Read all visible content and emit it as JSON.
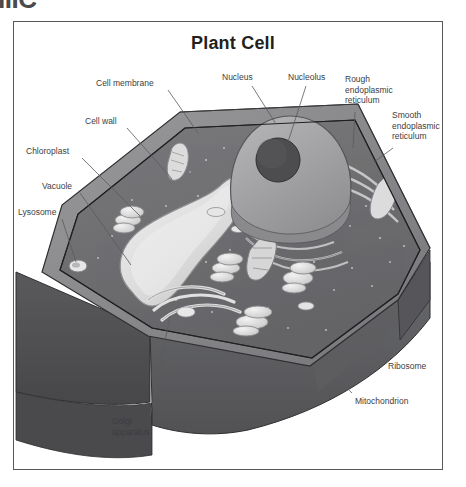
{
  "artifact": {
    "clipped_text": "IIIC"
  },
  "figure": {
    "title": "Plant Cell",
    "type": "labeled-biological-diagram",
    "frame": {
      "border_color": "#58585a",
      "background": "#ffffff"
    },
    "palette": {
      "cytoplasm": "#6e6e70",
      "cell_wall": "#8b8b8d",
      "cell_wall_dark": "#57575a",
      "side_face_left": "#4f4f52",
      "side_face_right": "#5d5d60",
      "nucleus": "#a6a6a8",
      "nucleus_shadow": "#7b7b7e",
      "nucleolus": "#4a4a4c",
      "vacuole": "#d8d8d8",
      "organelle_light": "#e3e3e3",
      "outline": "#2f2f31",
      "leader_line": "#5a5a5c",
      "label_text": "#3d3d3f"
    },
    "labels": [
      {
        "id": "cell-membrane",
        "text": "Cell membrane",
        "x": 96,
        "y": 80,
        "align": "left",
        "leader": [
          [
            168,
            90
          ],
          [
            196,
            132
          ]
        ]
      },
      {
        "id": "cell-wall",
        "text": "Cell wall",
        "x": 85,
        "y": 118,
        "align": "left",
        "leader": [
          [
            127,
            128
          ],
          [
            171,
            178
          ]
        ]
      },
      {
        "id": "chloroplast",
        "text": "Chloroplast",
        "x": 26,
        "y": 148,
        "align": "left",
        "leader": [
          [
            80,
            158
          ],
          [
            140,
            215
          ]
        ]
      },
      {
        "id": "vacuole",
        "text": "Vacuole",
        "x": 42,
        "y": 183,
        "align": "left",
        "leader": [
          [
            80,
            193
          ],
          [
            130,
            264
          ]
        ]
      },
      {
        "id": "lysosome",
        "text": "Lysosome",
        "x": 20,
        "y": 209,
        "align": "left",
        "leader": [
          [
            66,
            219
          ],
          [
            78,
            265
          ]
        ]
      },
      {
        "id": "nucleus",
        "text": "Nucleus",
        "x": 222,
        "y": 74,
        "align": "left",
        "leader": [
          [
            254,
            86
          ],
          [
            275,
            122
          ]
        ]
      },
      {
        "id": "nucleolus",
        "text": "Nucleolus",
        "x": 288,
        "y": 74,
        "align": "left",
        "leader": [
          [
            304,
            86
          ],
          [
            287,
            140
          ]
        ]
      },
      {
        "id": "rough-endoplasmic-reticulum",
        "text": "Rough\nendoplasmic\nreticulum",
        "x": 345,
        "y": 76,
        "align": "left",
        "leader": [
          [
            355,
            112
          ],
          [
            354,
            146
          ]
        ]
      },
      {
        "id": "smooth-endoplasmic-reticulum",
        "text": "Smooth\nendoplasmic\nreticulum",
        "x": 392,
        "y": 112,
        "align": "left",
        "leader": [
          [
            392,
            148
          ],
          [
            375,
            160
          ]
        ]
      },
      {
        "id": "ribosome",
        "text": "Ribosome",
        "x": 388,
        "y": 364,
        "align": "left",
        "leader": [
          [
            387,
            362
          ],
          [
            360,
            335
          ]
        ]
      },
      {
        "id": "mitochondrion",
        "text": "Mitochondrion",
        "x": 356,
        "y": 398,
        "align": "left",
        "leader": [
          [
            354,
            396
          ],
          [
            330,
            372
          ]
        ]
      },
      {
        "id": "golgi-apparatus",
        "text": "Golgi\napparatus",
        "x": 112,
        "y": 420,
        "align": "left",
        "leader": [
          [
            148,
            420
          ],
          [
            168,
            318
          ]
        ]
      }
    ]
  }
}
